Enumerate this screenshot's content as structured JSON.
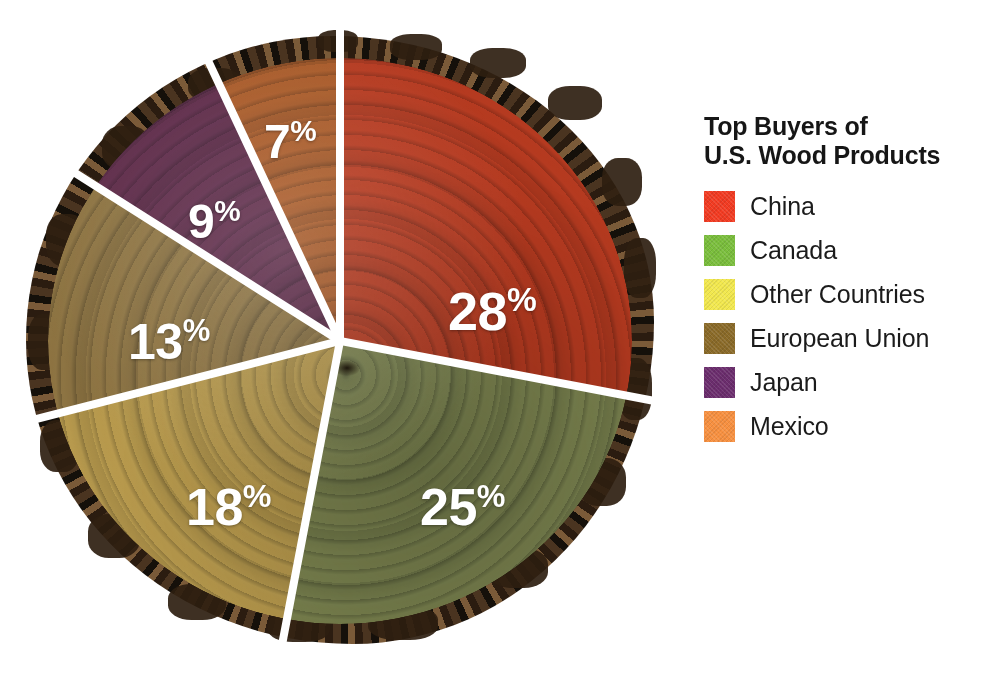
{
  "page": {
    "background_color": "#FFFFFF",
    "clipped_top_line": ""
  },
  "legend": {
    "title_line1": "Top Buyers of",
    "title_line2": "U.S. Wood Products",
    "items": [
      {
        "label": "China",
        "color": "#F23B22"
      },
      {
        "label": "Canada",
        "color": "#7ABE3C"
      },
      {
        "label": "Other Countries",
        "color": "#F2E84E"
      },
      {
        "label": "European Union",
        "color": "#8A6A28"
      },
      {
        "label": "Japan",
        "color": "#6B2D6D"
      },
      {
        "label": "Mexico",
        "color": "#F79040"
      }
    ]
  },
  "chart_data": {
    "type": "pie",
    "title": "Top Buyers of U.S. Wood Products",
    "subtitle": "",
    "xlabel": "",
    "ylabel": "",
    "unit": "percent",
    "total": 100,
    "legend_position": "right",
    "grid": false,
    "start_angle_deg": 0,
    "direction": "clockwise",
    "categories": [
      "China",
      "Canada",
      "Other Countries",
      "European Union",
      "Japan",
      "Mexico"
    ],
    "values": [
      28,
      25,
      18,
      13,
      9,
      7
    ],
    "labels": [
      "28%",
      "25%",
      "18%",
      "13%",
      "9%",
      "7%"
    ],
    "colors": [
      "#F23B22",
      "#7ABE3C",
      "#F2E84E",
      "#8A6A28",
      "#6B2D6D",
      "#F79040"
    ],
    "slices": [
      {
        "name": "China",
        "value": 28,
        "label": "28%",
        "color": "#F23B22",
        "pie_color": "#B53A20",
        "start_deg": 0,
        "end_deg": 100.8,
        "label_x": 430,
        "label_y": 255,
        "label_size": 54
      },
      {
        "name": "Canada",
        "value": 25,
        "label": "25%",
        "color": "#7ABE3C",
        "pie_color": "#7C8551",
        "start_deg": 100.8,
        "end_deg": 190.8,
        "label_x": 402,
        "label_y": 452,
        "label_size": 52
      },
      {
        "name": "Other Countries",
        "value": 18,
        "label": "18%",
        "color": "#F2E84E",
        "pie_color": "#B79A4E",
        "start_deg": 190.8,
        "end_deg": 255.6,
        "label_x": 168,
        "label_y": 452,
        "label_size": 52
      },
      {
        "name": "European Union",
        "value": 13,
        "label": "13%",
        "color": "#8A6A28",
        "pie_color": "#8D7443",
        "start_deg": 255.6,
        "end_deg": 302.4,
        "label_x": 110,
        "label_y": 287,
        "label_size": 50
      },
      {
        "name": "Japan",
        "value": 9,
        "label": "9%",
        "color": "#6B2D6D",
        "pie_color": "#5E2B4A",
        "start_deg": 302.4,
        "end_deg": 334.8,
        "label_x": 170,
        "label_y": 168,
        "label_size": 48
      },
      {
        "name": "Mexico",
        "value": 7,
        "label": "7%",
        "color": "#F79040",
        "pie_color": "#A85A28",
        "start_deg": 334.8,
        "end_deg": 360,
        "label_x": 246,
        "label_y": 88,
        "label_size": 48
      }
    ],
    "percent_symbol": "%",
    "label_color": "#FFFFFF",
    "separator_color": "#FFFFFF"
  }
}
